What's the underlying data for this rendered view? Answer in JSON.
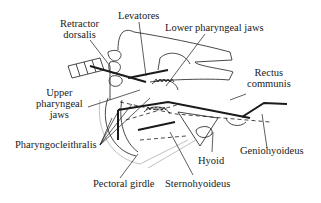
{
  "diagram": {
    "type": "anatomical-line-drawing",
    "labels": {
      "retractor_dorsalis_1": "Retractor",
      "retractor_dorsalis_2": "dorsalis",
      "levatores": "Levatores",
      "lower_pharyngeal_jaws": "Lower pharyngeal jaws",
      "rectus_communis_1": "Rectus",
      "rectus_communis_2": "communis",
      "upper_pharyngeal_jaws_1": "Upper",
      "upper_pharyngeal_jaws_2": "pharyngeal",
      "upper_pharyngeal_jaws_3": "jaws",
      "pharyngocleithralis": "Pharyngocleithralis",
      "hyoid": "Hyoid",
      "geniohyoideus": "Geniohyoideus",
      "pectoral_girdle": "Pectoral girdle",
      "sternohyoideus": "Sternohyoideus"
    },
    "colors": {
      "line": "#1a1a1a",
      "faint_line": "#b0b0b0",
      "background": "#ffffff"
    }
  }
}
